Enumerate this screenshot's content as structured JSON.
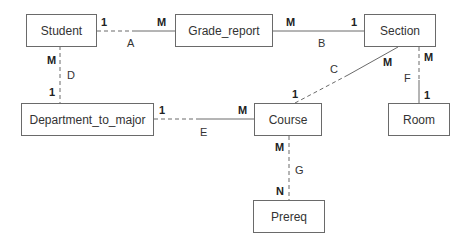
{
  "entities": {
    "student": "Student",
    "grade_report": "Grade_report",
    "section": "Section",
    "department_to_major": "Department_to_major",
    "course": "Course",
    "room": "Room",
    "prereq": "Prereq"
  },
  "relationships": {
    "A": {
      "label": "A",
      "from": "Student",
      "to": "Grade_report",
      "from_card": "1",
      "to_card": "M"
    },
    "B": {
      "label": "B",
      "from": "Grade_report",
      "to": "Section",
      "from_card": "M",
      "to_card": "1"
    },
    "C": {
      "label": "C",
      "from": "Section",
      "to": "Course",
      "from_card": "M",
      "to_card": "1"
    },
    "D": {
      "label": "D",
      "from": "Student",
      "to": "Department_to_major",
      "from_card": "M",
      "to_card": "1"
    },
    "E": {
      "label": "E",
      "from": "Department_to_major",
      "to": "Course",
      "from_card": "1",
      "to_card": "M"
    },
    "F": {
      "label": "F",
      "from": "Section",
      "to": "Room",
      "from_card": "M",
      "to_card": "1"
    },
    "G": {
      "label": "G",
      "from": "Course",
      "to": "Prereq",
      "from_card": "M",
      "to_card": "N"
    }
  },
  "colors": {
    "line": "#6a6a6a",
    "text": "#333333"
  }
}
